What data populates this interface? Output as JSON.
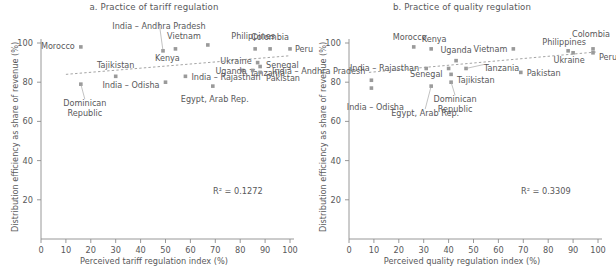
{
  "figure": {
    "panels": [
      "a",
      "b"
    ]
  },
  "chart_data": [
    {
      "type": "scatter",
      "panel_id": "a",
      "title": "a. Practice of tariff regulation",
      "xlabel": "Perceived tariff regulation index (%)",
      "ylabel": "Distribution efficiency as share of revenue (%)",
      "xlim": [
        0,
        100
      ],
      "ylim": [
        0,
        100
      ],
      "xticks": [
        0,
        10,
        20,
        30,
        40,
        50,
        60,
        70,
        80,
        90,
        100
      ],
      "yticks": [
        20,
        40,
        60,
        80,
        100
      ],
      "grid": false,
      "legend": "none",
      "annotation": "R² = 0.1272",
      "r_squared": 0.1272,
      "trendline": {
        "x": [
          10,
          100
        ],
        "y": [
          84.0,
          93.5
        ],
        "style": "dashed"
      },
      "points": [
        {
          "label": "Morocco",
          "x": 16,
          "y": 98
        },
        {
          "label": "Dominican Republic",
          "x": 16,
          "y": 79
        },
        {
          "label": "Tajikistan",
          "x": 30,
          "y": 83
        },
        {
          "label": "India – Andhra Pradesh",
          "x": 49,
          "y": 96
        },
        {
          "label": "India – Odisha",
          "x": 50,
          "y": 80
        },
        {
          "label": "Kenya",
          "x": 54,
          "y": 97
        },
        {
          "label": "India – Rajasthan",
          "x": 58,
          "y": 83
        },
        {
          "label": "Vietnam",
          "x": 67,
          "y": 99
        },
        {
          "label": "Egypt, Arab Rep.",
          "x": 69,
          "y": 78
        },
        {
          "label": "Tanzania",
          "x": 81,
          "y": 86
        },
        {
          "label": "Uganda",
          "x": 85,
          "y": 86
        },
        {
          "label": "Philippines",
          "x": 86,
          "y": 97
        },
        {
          "label": "Ukraine",
          "x": 87,
          "y": 90
        },
        {
          "label": "Senegal",
          "x": 88,
          "y": 88
        },
        {
          "label": "Pakistan",
          "x": 88,
          "y": 85
        },
        {
          "label": "Colombia",
          "x": 92,
          "y": 97
        },
        {
          "label": "Peru",
          "x": 100,
          "y": 97
        }
      ]
    },
    {
      "type": "scatter",
      "panel_id": "b",
      "title": "b. Practice of quality regulation",
      "xlabel": "Perceived quality regulation index (%)",
      "ylabel": "Distribution efficiency as share of revenue (%)",
      "xlim": [
        0,
        100
      ],
      "ylim": [
        0,
        100
      ],
      "xticks": [
        0,
        10,
        20,
        30,
        40,
        50,
        60,
        70,
        80,
        90,
        100
      ],
      "yticks": [
        20,
        40,
        60,
        80,
        100
      ],
      "grid": false,
      "legend": "none",
      "annotation": "R² = 0.3309",
      "r_squared": 0.3309,
      "trendline": {
        "x": [
          8,
          100
        ],
        "y": [
          85.0,
          95.5
        ],
        "style": "dashed"
      },
      "points": [
        {
          "label": "India – Andhra Pradesh",
          "x": 9,
          "y": 81
        },
        {
          "label": "India – Odisha",
          "x": 9,
          "y": 77
        },
        {
          "label": "Morocco",
          "x": 26,
          "y": 98
        },
        {
          "label": "India – Rajasthan",
          "x": 31,
          "y": 87
        },
        {
          "label": "Kenya",
          "x": 33,
          "y": 97
        },
        {
          "label": "Egypt, Arab Rep.",
          "x": 33,
          "y": 78
        },
        {
          "label": "Senegal",
          "x": 40,
          "y": 87
        },
        {
          "label": "Dominican Republic",
          "x": 41,
          "y": 80
        },
        {
          "label": "Tajikistan",
          "x": 41,
          "y": 84
        },
        {
          "label": "Uganda",
          "x": 43,
          "y": 91
        },
        {
          "label": "Tanzania",
          "x": 47,
          "y": 87
        },
        {
          "label": "Vietnam",
          "x": 66,
          "y": 97
        },
        {
          "label": "Pakistan",
          "x": 69,
          "y": 85
        },
        {
          "label": "Philippines",
          "x": 88,
          "y": 96
        },
        {
          "label": "Ukraine",
          "x": 90,
          "y": 95
        },
        {
          "label": "Colombia",
          "x": 98,
          "y": 97
        },
        {
          "label": "Peru",
          "x": 98,
          "y": 95
        }
      ]
    }
  ]
}
